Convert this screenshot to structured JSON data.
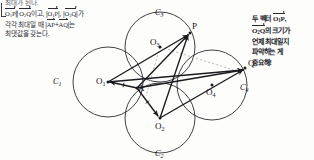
{
  "left_note": {
    "cut_top_line": "최대가 된다.",
    "lines": [
      {
        "id": "l1",
        "text": "O₁P∥O₂Q이고, |O₁P|, |O₂Q|가"
      },
      {
        "id": "l2",
        "text": "각각 최대일 때 |AP+AQ|는"
      },
      {
        "id": "l3",
        "text": "최댓값을 갖는다."
      }
    ],
    "line1_parts": {
      "v1": "O",
      "v1sub": "1",
      "v1b": "P",
      "parallel": "∥",
      "v2": "O",
      "v2sub": "2",
      "v2b": "Q",
      "tail": "이고,",
      "m1": "O",
      "m1sub": "1",
      "m1b": "P",
      "comma": ",",
      "m2": "O",
      "m2sub": "2",
      "m2b": "Q",
      "end": "가"
    },
    "line2_parts": {
      "lead": "각각 최대일 때",
      "a1": "AP",
      "plus": "+",
      "a2": "AQ",
      "end": "는"
    },
    "line3_text": "최댓값을 갖는다."
  },
  "right_note": {
    "lines": [
      "두 벡터 O₁P,",
      "O₂Q의 크기가",
      "언제 최대일지",
      "파악하는 게",
      "중요해!"
    ],
    "l1_a": "두 벡터 ",
    "l1_v": "O",
    "l1_vs": "1",
    "l1_vb": "P",
    "l1_c": ",",
    "l2_v": "O",
    "l2_vs": "2",
    "l2_vb": "Q",
    "l2_rest": "의 크기가",
    "l3": "언제 최대일지",
    "l4": "파악하는 게",
    "l5": "중요해!"
  },
  "figure": {
    "circles": [
      {
        "name": "C1",
        "label": "C",
        "sub": "1",
        "cx": 108,
        "cy": 82,
        "r": 35,
        "label_x": 53,
        "label_y": 78
      },
      {
        "name": "C2",
        "label": "C",
        "sub": "2",
        "cx": 160,
        "cy": 118,
        "r": 35,
        "label_x": 155,
        "label_y": 150
      },
      {
        "name": "C3",
        "label": "C",
        "sub": "3",
        "cx": 160,
        "cy": 47,
        "r": 35,
        "label_x": 155,
        "label_y": 9
      },
      {
        "name": "C4",
        "label": "C",
        "sub": "4",
        "cx": 212,
        "cy": 85,
        "r": 35,
        "label_x": 240,
        "label_y": 84
      }
    ],
    "points": [
      {
        "name": "O1",
        "label": "O",
        "sub": "1",
        "x": 108,
        "y": 82,
        "label_x": 96,
        "label_y": 77
      },
      {
        "name": "O2",
        "label": "O",
        "sub": "2",
        "x": 160,
        "y": 118,
        "label_x": 155,
        "label_y": 122
      },
      {
        "name": "O3",
        "label": "O",
        "sub": "3",
        "x": 160,
        "y": 47,
        "label_x": 150,
        "label_y": 38
      },
      {
        "name": "O4",
        "label": "O",
        "sub": "4",
        "x": 212,
        "y": 85,
        "label_x": 206,
        "label_y": 88
      },
      {
        "name": "A",
        "label": "A",
        "sub": "",
        "x": 137,
        "y": 88,
        "label_x": 138,
        "label_y": 84
      },
      {
        "name": "P",
        "label": "P",
        "sub": "",
        "x": 190,
        "y": 33,
        "label_x": 192,
        "label_y": 22
      },
      {
        "name": "Q",
        "label": "Q",
        "sub": "",
        "x": 245,
        "y": 68,
        "label_x": 248,
        "label_y": 59
      }
    ],
    "vectors": [
      {
        "from": "A",
        "to": "O1",
        "x1": 137,
        "y1": 88,
        "x2": 110,
        "y2": 82,
        "tick": true
      },
      {
        "from": "A",
        "to": "O2",
        "x1": 137,
        "y1": 88,
        "x2": 158,
        "y2": 116,
        "tick": true
      },
      {
        "from": "A",
        "to": "P",
        "x1": 137,
        "y1": 88,
        "x2": 188,
        "y2": 35
      },
      {
        "from": "A",
        "to": "Q",
        "x1": 137,
        "y1": 88,
        "x2": 243,
        "y2": 70
      },
      {
        "from": "O1",
        "to": "P",
        "x1": 108,
        "y1": 82,
        "x2": 188,
        "y2": 35
      },
      {
        "from": "O1",
        "to": "Q",
        "x1": 108,
        "y1": 82,
        "x2": 243,
        "y2": 70
      },
      {
        "from": "O2",
        "to": "P",
        "x1": 160,
        "y1": 118,
        "x2": 188,
        "y2": 35
      },
      {
        "from": "O2",
        "to": "Q",
        "x1": 160,
        "y1": 118,
        "x2": 243,
        "y2": 70
      }
    ],
    "dashed": [
      {
        "from": "O3",
        "to": "Q",
        "x1": 160,
        "y1": 47,
        "x2": 240,
        "y2": 72
      },
      {
        "from": "O3",
        "to": "A",
        "x1": 160,
        "y1": 47,
        "x2": 146,
        "y2": 96
      }
    ],
    "colors": {
      "stroke": "#1a1a1f",
      "circle": "#2a2a30",
      "dashed": "#b0a8a4",
      "text": "#141418"
    }
  }
}
